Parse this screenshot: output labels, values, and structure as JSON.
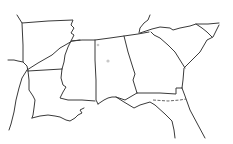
{
  "map": {
    "title": "Southeastern United States state borders outline",
    "background": "#ffffff",
    "line_color": "#3a3a3a",
    "paths": [
      {
        "name": "arkansas-north-border",
        "style": "border",
        "d": "M17,15 L22,23 L48,21 L73,20 L71,25 L74,28 L71,33 L74,35 L71,41"
      },
      {
        "name": "arkansas-west-border",
        "style": "border",
        "d": "M22,23 L23,45 L23,62 L27,66 L28,71"
      },
      {
        "name": "texas-oklahoma-red-river",
        "style": "border",
        "d": "M8,60 L14,60 L18,61 L23,62"
      },
      {
        "name": "mississippi-river-east-arkansas",
        "style": "border",
        "d": "M71,41 L68,47 L65,55 L64,62 L62,69"
      },
      {
        "name": "railway-diagonal",
        "style": "border",
        "d": "M27,70 L38,63 L52,55 L60,48 L67,44 L72,41 L80,40"
      },
      {
        "name": "louisiana-arkansas-border",
        "style": "border",
        "d": "M28,71 L45,70 L62,69"
      },
      {
        "name": "texas-louisiana-border",
        "style": "border",
        "d": "M28,71 L29,80 L29,90 L33,96 L35,100 L34,108 L33,115 L32,118"
      },
      {
        "name": "texas-east-outline",
        "style": "border",
        "d": "M27,70 L22,78 L19,88 L16,100 L14,112 L11,124 L9,130"
      },
      {
        "name": "louisiana-coast",
        "style": "border",
        "d": "M32,118 L40,116 L48,115 L55,116 L60,117 L66,120 L70,121 L75,118 L78,115 L82,113 L80,110 L84,108"
      },
      {
        "name": "mississippi-river-louisiana",
        "style": "border",
        "d": "M62,69 L61,78 L63,85 L66,87 L63,92 L60,98 L68,100 L82,100 L95,101"
      },
      {
        "name": "mississippi-alabama-border",
        "style": "border",
        "d": "M95,40 L95,60 L96,80 L96,100 L98,104"
      },
      {
        "name": "tennessee-south-border",
        "style": "border",
        "d": "M72,41 L82,40 L95,40 L110,38 L124,36 L138,34 L149,32"
      },
      {
        "name": "alabama-georgia-border",
        "style": "border",
        "d": "M124,36 L128,52 L133,68 L135,74 L133,80 L137,93"
      },
      {
        "name": "gulf-coast-mississippi-alabama",
        "style": "border",
        "d": "M98,104 L104,100 L108,98 L112,97 L116,97 L119,98 L125,100 L137,93"
      },
      {
        "name": "georgia-florida-border",
        "style": "border",
        "d": "M137,93 L160,93 L176,94 L176,88 L182,88"
      },
      {
        "name": "georgia-florida-dashed",
        "style": "dashed",
        "d": "M153,100 L168,101 L180,100 L186,99"
      },
      {
        "name": "florida-panhandle-coast",
        "style": "border",
        "d": "M116,97 L124,102 L134,108 L140,105 L150,102 L155,105 L165,114 L172,121 L174,130 L175,138"
      },
      {
        "name": "georgia-atlantic-border",
        "style": "border",
        "d": "M182,88 L183,80 L184,68 L192,60 L200,52 L207,40 L213,37 L219,25"
      },
      {
        "name": "florida-atlantic-coast",
        "style": "border",
        "d": "M182,88 L185,96 L190,110 L198,125 L205,138"
      },
      {
        "name": "north-carolina-south-border",
        "style": "border",
        "d": "M140,33 L152,29 L160,27 L170,28 L173,30 L180,28 L190,26 L196,24 L208,24 L219,23"
      },
      {
        "name": "south-carolina-west-border",
        "style": "border",
        "d": "M151,32 L154,35 L160,38 L168,45 L175,52 L180,60 L185,68"
      },
      {
        "name": "north-carolina-south-carolina-border",
        "style": "border",
        "d": "M196,24 L202,28 L207,32 L212,37"
      },
      {
        "name": "tennessee-hook",
        "style": "border",
        "d": "M150,15 L148,20 L144,23 L140,28 L139,33"
      }
    ],
    "markers": [
      {
        "name": "marker-dot-1",
        "x": 98,
        "y": 45,
        "r": 1.3
      },
      {
        "name": "marker-dot-2",
        "x": 108,
        "y": 61,
        "r": 1.6
      }
    ]
  }
}
